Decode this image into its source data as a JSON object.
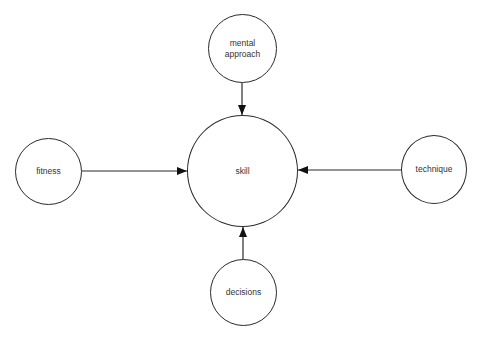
{
  "diagram": {
    "type": "concept-influence",
    "colors": {
      "stroke": "#2a2a2a",
      "text": "#333333",
      "background": "#ffffff"
    },
    "center_node": {
      "id": "skill",
      "label": "skill"
    },
    "nodes": [
      {
        "id": "mental_approach",
        "label": "mental\napproach",
        "position": "top"
      },
      {
        "id": "fitness",
        "label": "fitness",
        "position": "left"
      },
      {
        "id": "technique",
        "label": "technique",
        "position": "right"
      },
      {
        "id": "decisions",
        "label": "decisions",
        "position": "bottom"
      }
    ],
    "edges": [
      {
        "from": "mental approach",
        "to": "skill"
      },
      {
        "from": "fitness",
        "to": "skill"
      },
      {
        "from": "technique",
        "to": "skill"
      },
      {
        "from": "decisions",
        "to": "skill"
      }
    ]
  }
}
